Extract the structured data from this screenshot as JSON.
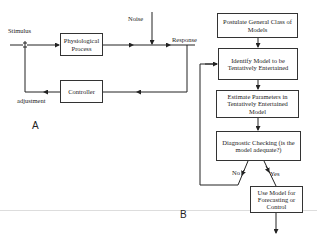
{
  "panel_a": {
    "label": "A",
    "stimulus_label": "Stimulus",
    "noise_label": "Noise",
    "response_label": "Response",
    "adjustment_label": "adjustment",
    "physiological_process": "Physiological Process",
    "controller": "Controller"
  },
  "panel_b": {
    "label": "B",
    "steps": [
      "Postulate General Class of Models",
      "Identify Model to be Tentatively Entertained",
      "Estimate Parameters in Tentatively Entertained Model",
      "Diagnostic Checking (is the model adequate?)",
      "Use Model for Forecasting or Control"
    ],
    "no_label": "No",
    "yes_label": "Yes"
  }
}
